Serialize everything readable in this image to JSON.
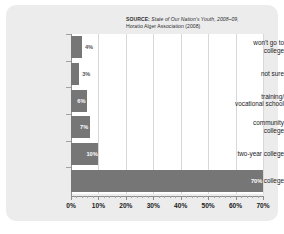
{
  "source": {
    "lead": "SOURCE:",
    "italic_part": " State of Our Nation's Youth, 2008–09,",
    "line2": "Horatio Alger Association (2008)"
  },
  "chart_data": {
    "type": "bar",
    "orientation": "horizontal",
    "title": "",
    "xlabel": "",
    "ylabel": "",
    "xlim": [
      0,
      70
    ],
    "grid": true,
    "legend": false,
    "categories": [
      "won't go to college",
      "not sure",
      "training/ vocational school",
      "community college",
      "two-year college",
      "four-year college"
    ],
    "values": [
      4,
      3,
      6,
      7,
      10,
      70
    ],
    "value_labels": [
      "4%",
      "3%",
      "6%",
      "7%",
      "10%",
      "70%"
    ],
    "tick_labels": [
      "0%",
      "10%",
      "20%",
      "30%",
      "40%",
      "50%",
      "60%",
      "70%"
    ],
    "tick_values": [
      0,
      10,
      20,
      30,
      40,
      50,
      60,
      70
    ],
    "bar_color": "#767676",
    "plot_background": "#ffffff",
    "panel_background": "#ececed",
    "gridline_color": "#d8d8d8"
  },
  "categories_display": [
    {
      "line1": "won't go to",
      "line2": "college"
    },
    {
      "line1": "not sure",
      "line2": ""
    },
    {
      "line1": "training/",
      "line2": "vocational school"
    },
    {
      "line1": "community",
      "line2": "college"
    },
    {
      "line1": "two-year college",
      "line2": ""
    },
    {
      "line1": "four-year college",
      "line2": ""
    }
  ]
}
